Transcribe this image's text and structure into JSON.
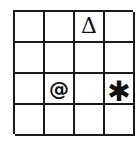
{
  "grid": {
    "rows": 4,
    "cols": 4,
    "cells": [
      [
        "",
        "",
        "Δ",
        ""
      ],
      [
        "",
        "",
        "",
        ""
      ],
      [
        "",
        "@",
        "",
        "✱"
      ],
      [
        "",
        "",
        "",
        ""
      ]
    ],
    "symbols": [
      {
        "row": 0,
        "col": 2,
        "glyph": "Δ",
        "name": "delta-triangle-icon"
      },
      {
        "row": 2,
        "col": 1,
        "glyph": "@",
        "name": "at-sign-icon"
      },
      {
        "row": 2,
        "col": 3,
        "glyph": "✱",
        "name": "asterisk-icon"
      }
    ],
    "line_color": "#1a1a1a",
    "background": "#ffffff"
  }
}
